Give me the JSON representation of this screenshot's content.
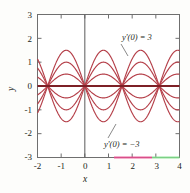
{
  "figure": {
    "title": "",
    "background_color": "#fdfdfb",
    "frame_color": "#6f6f6f",
    "curve_color": "#b5404a",
    "axis_color": "#4a4a4a",
    "text_color": "#231f20"
  },
  "axes": {
    "x_label": "x",
    "y_label": "y",
    "x_ticks": [
      "-2",
      "-1",
      "0",
      "1",
      "2",
      "3",
      "4"
    ],
    "y_ticks": [
      "3",
      "2",
      "1",
      "0",
      "-1",
      "-2",
      "-3"
    ]
  },
  "annotations": {
    "upper": "y'(0) = 3",
    "lower": "y'(0) = −3"
  },
  "artifacts": {
    "pink_segment_color": "#ea4a8e",
    "green_segment_color": "#7fe08a"
  },
  "chart_data": {
    "type": "line",
    "title": "",
    "xlabel": "x",
    "ylabel": "y",
    "xlim": [
      -2,
      4
    ],
    "ylim": [
      -3,
      3
    ],
    "xticks": [
      -2,
      -1,
      0,
      1,
      2,
      3,
      4
    ],
    "yticks": [
      -3,
      -2,
      -1,
      0,
      1,
      2,
      3
    ],
    "grid": false,
    "legend": null,
    "node_x_values": [
      -1.5708,
      0,
      1.5708,
      3.1416
    ],
    "series": [
      {
        "name": "y'(0) = 3",
        "amplitude": 1.5,
        "period": 3.1416,
        "phase": 0
      },
      {
        "name": "y'(0) = 2",
        "amplitude": 1.0,
        "period": 3.1416,
        "phase": 0
      },
      {
        "name": "y'(0) = 1",
        "amplitude": 0.5,
        "period": 3.1416,
        "phase": 0
      },
      {
        "name": "y'(0) = 0",
        "amplitude": 0.0,
        "period": 3.1416,
        "phase": 0
      },
      {
        "name": "y'(0) = -1",
        "amplitude": -0.5,
        "period": 3.1416,
        "phase": 0
      },
      {
        "name": "y'(0) = -2",
        "amplitude": -1.0,
        "period": 3.1416,
        "phase": 0
      },
      {
        "name": "y'(0) = -3",
        "amplitude": -1.5,
        "period": 3.1416,
        "phase": 0
      }
    ]
  }
}
